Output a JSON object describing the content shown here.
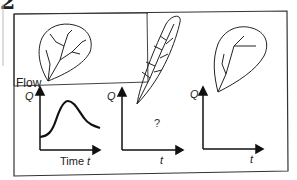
{
  "figure": {
    "corner_mark": "2",
    "panels": [
      {
        "id": "round-basin",
        "basin_shape": "round leaf-shaped basin with branching drainage network",
        "y_label": "Flow",
        "y_symbol": "Q",
        "x_label": "Time",
        "x_symbol": "t",
        "hydrograph": "curve rising from low baseline to a peak then gradually falling"
      },
      {
        "id": "elongated-basin",
        "basin_shape": "long narrow leaf-shaped basin with pinnate drainage",
        "y_symbol": "Q",
        "x_symbol": "t",
        "placeholder": "?"
      },
      {
        "id": "sparse-basin",
        "basin_shape": "round basin with sparse drainage network",
        "y_symbol": "Q",
        "x_symbol": "t"
      }
    ]
  }
}
